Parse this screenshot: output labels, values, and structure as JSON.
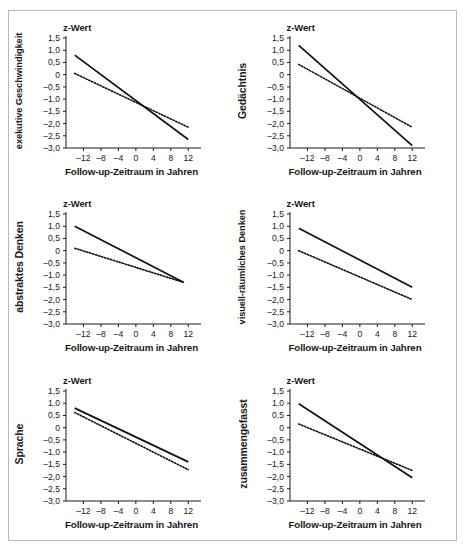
{
  "figure": {
    "panel_count": 6,
    "shared": {
      "z_title": "z-Wert",
      "x_title": "Follow-up-Zeitraum in Jahren",
      "y_ticks": [
        "1,5",
        "1,0",
        "0,5",
        "0",
        "-0,5",
        "-1,0",
        "-1,5",
        "-2,0",
        "-2,5",
        "-3,0"
      ],
      "x_ticks": [
        "-12",
        "-8",
        "-4",
        "0",
        "4",
        "8",
        "12"
      ]
    }
  },
  "chart_data": [
    {
      "type": "line",
      "title": "z-Wert",
      "panel_label": "exekutive Geschwindigkeit",
      "xlabel": "Follow-up-Zeitraum in Jahren",
      "ylabel": "z-Wert",
      "xlim": [
        -16,
        14
      ],
      "ylim": [
        -3.0,
        1.5
      ],
      "xticks": [
        -12,
        -8,
        -4,
        0,
        4,
        8,
        12
      ],
      "yticks": [
        1.5,
        1.0,
        0.5,
        0,
        -0.5,
        -1.0,
        -1.5,
        -2.0,
        -2.5,
        -3.0
      ],
      "grid": false,
      "legend": "none",
      "series": [
        {
          "name": "solid",
          "style": "solid",
          "x": [
            -14,
            12
          ],
          "y": [
            0.8,
            -2.65
          ]
        },
        {
          "name": "dotted",
          "style": "dotted",
          "x": [
            -14,
            12
          ],
          "y": [
            0.05,
            -2.15
          ]
        }
      ]
    },
    {
      "type": "line",
      "title": "z-Wert",
      "panel_label": "Gedächtnis",
      "xlabel": "Follow-up-Zeitraum in Jahren",
      "ylabel": "z-Wert",
      "xlim": [
        -16,
        14
      ],
      "ylim": [
        -3.0,
        1.5
      ],
      "xticks": [
        -12,
        -8,
        -4,
        0,
        4,
        8,
        12
      ],
      "yticks": [
        1.5,
        1.0,
        0.5,
        0,
        -0.5,
        -1.0,
        -1.5,
        -2.0,
        -2.5,
        -3.0
      ],
      "grid": false,
      "legend": "none",
      "series": [
        {
          "name": "solid",
          "style": "solid",
          "x": [
            -14,
            12
          ],
          "y": [
            1.2,
            -2.9
          ]
        },
        {
          "name": "dotted",
          "style": "dotted",
          "x": [
            -14,
            12
          ],
          "y": [
            0.42,
            -2.15
          ]
        }
      ]
    },
    {
      "type": "line",
      "title": "z-Wert",
      "panel_label": "abstraktes Denken",
      "xlabel": "Follow-up-Zeitraum in Jahren",
      "ylabel": "z-Wert",
      "xlim": [
        -16,
        14
      ],
      "ylim": [
        -3.0,
        1.5
      ],
      "xticks": [
        -12,
        -8,
        -4,
        0,
        4,
        8,
        12
      ],
      "yticks": [
        1.5,
        1.0,
        0.5,
        0,
        -0.5,
        -1.0,
        -1.5,
        -2.0,
        -2.5,
        -3.0
      ],
      "grid": false,
      "legend": "none",
      "series": [
        {
          "name": "solid",
          "style": "solid",
          "x": [
            -14,
            11
          ],
          "y": [
            1.0,
            -1.3
          ]
        },
        {
          "name": "dotted",
          "style": "dotted",
          "x": [
            -14,
            11
          ],
          "y": [
            0.1,
            -1.3
          ]
        }
      ]
    },
    {
      "type": "line",
      "title": "z-Wert",
      "panel_label": "visuell-räumliches Denken",
      "xlabel": "Follow-up-Zeitraum in Jahren",
      "ylabel": "z-Wert",
      "xlim": [
        -16,
        14
      ],
      "ylim": [
        -3.0,
        1.5
      ],
      "xticks": [
        -12,
        -8,
        -4,
        0,
        4,
        8,
        12
      ],
      "yticks": [
        1.5,
        1.0,
        0.5,
        0,
        -0.5,
        -1.0,
        -1.5,
        -2.0,
        -2.5,
        -3.0
      ],
      "grid": false,
      "legend": "none",
      "series": [
        {
          "name": "solid",
          "style": "solid",
          "x": [
            -14,
            12
          ],
          "y": [
            0.92,
            -1.5
          ]
        },
        {
          "name": "dotted",
          "style": "dotted",
          "x": [
            -14,
            12
          ],
          "y": [
            0.0,
            -2.0
          ]
        }
      ]
    },
    {
      "type": "line",
      "title": "z-Wert",
      "panel_label": "Sprache",
      "xlabel": "Follow-up-Zeitraum in Jahren",
      "ylabel": "z-Wert",
      "xlim": [
        -16,
        14
      ],
      "ylim": [
        -3.0,
        1.5
      ],
      "xticks": [
        -12,
        -8,
        -4,
        0,
        4,
        8,
        12
      ],
      "yticks": [
        1.5,
        1.0,
        0.5,
        0,
        -0.5,
        -1.0,
        -1.5,
        -2.0,
        -2.5,
        -3.0
      ],
      "grid": false,
      "legend": "none",
      "series": [
        {
          "name": "solid",
          "style": "solid",
          "x": [
            -14,
            12
          ],
          "y": [
            0.8,
            -1.4
          ]
        },
        {
          "name": "dotted",
          "style": "dotted",
          "x": [
            -14,
            12
          ],
          "y": [
            0.62,
            -1.72
          ]
        }
      ]
    },
    {
      "type": "line",
      "title": "z-Wert",
      "panel_label": "zusammengefasst",
      "xlabel": "Follow-up-Zeitraum in Jahren",
      "ylabel": "z-Wert",
      "xlim": [
        -16,
        14
      ],
      "ylim": [
        -3.0,
        1.5
      ],
      "xticks": [
        -12,
        -8,
        -4,
        0,
        4,
        8,
        12
      ],
      "yticks": [
        1.5,
        1.0,
        0.5,
        0,
        -0.5,
        -1.0,
        -1.5,
        -2.0,
        -2.5,
        -3.0
      ],
      "grid": false,
      "legend": "none",
      "series": [
        {
          "name": "solid",
          "style": "solid",
          "x": [
            -14,
            12
          ],
          "y": [
            0.98,
            -2.05
          ]
        },
        {
          "name": "dotted",
          "style": "dotted",
          "x": [
            -14,
            12
          ],
          "y": [
            0.15,
            -1.75
          ]
        }
      ]
    }
  ]
}
